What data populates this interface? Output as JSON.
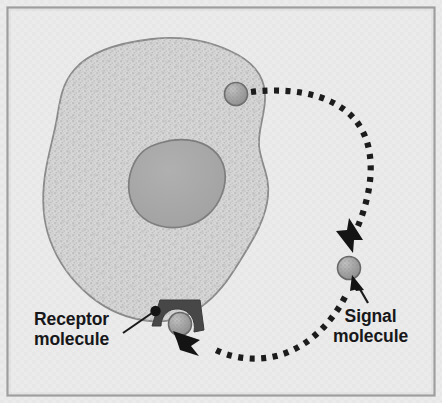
{
  "figure": {
    "width": 442,
    "height": 403
  },
  "labels": {
    "receptor": {
      "line1": "Receptor",
      "line2": "molecule",
      "name": "receptor-molecule-label"
    },
    "signal": {
      "line1": "Signal",
      "line2": "molecule",
      "name": "signal-molecule-label"
    }
  },
  "colors": {
    "background": "#ebebeb",
    "frame_border": "#9a9a9a",
    "cytoplasm": "#d4d4d4",
    "cytoplasm_speckle": "#bfbfbf",
    "membrane_outline": "#8a8a8a",
    "nucleus_fill": "#a8a8a8",
    "nucleus_outline": "#7a7a7a",
    "molecule_fill": "#a5a5a5",
    "molecule_outline": "#6e6e6e",
    "receptor_dark": "#4a4a4a",
    "arrow_black": "#1a1a1a",
    "text": "#17171a"
  },
  "elements": {
    "cell": "amoeboid cell with stippled cytoplasm",
    "nucleus": "dark gray oval nucleus",
    "internal_molecule": "signal molecule inside cell, upper right",
    "external_molecule": "signal molecule outside cell, right side",
    "bound_molecule": "signal molecule docked in receptor",
    "receptor": "dark trapezoidal receptor on membrane, bottom of cell",
    "receptor_dot": "black dot marking receptor attachment point",
    "path_upper": "dotted curved path from internal molecule out and down",
    "path_lower": "dotted curved path from below external molecule to receptor",
    "arrowhead_down": "arrowhead pointing down at external molecule",
    "arrowhead_receptor": "arrowhead pointing up-left at receptor",
    "pointer_signal": "thin arrow from signal label up to molecule",
    "leader_receptor": "leader line from receptor label to receptor dot"
  }
}
